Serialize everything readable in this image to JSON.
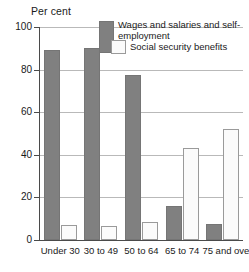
{
  "chart_data": {
    "type": "bar",
    "title": "",
    "ylabel": "Per cent",
    "xlabel": "",
    "ylim": [
      0,
      100
    ],
    "yticks": [
      0,
      20,
      40,
      60,
      80,
      100
    ],
    "grid": true,
    "legend_position": "inside-top-right",
    "categories": [
      "Under 30",
      "30 to 49",
      "50 to 64",
      "65 to 74",
      "75 and over"
    ],
    "series": [
      {
        "name": "Wages and salaries and self-employment",
        "color": "#808080",
        "values": [
          89,
          90,
          77.5,
          16,
          7.5
        ]
      },
      {
        "name": "Social security benefits",
        "color": "#fbfbfb",
        "values": [
          7,
          6.5,
          8.5,
          43,
          52
        ]
      }
    ]
  },
  "axis": {
    "y_title": "Per cent",
    "tick_labels": [
      "100",
      "80",
      "60",
      "40",
      "20",
      "0"
    ]
  },
  "legend": {
    "entry_1": "Wages and salaries and self-employment",
    "entry_2": "Social security benefits"
  },
  "categories": [
    "Under 30",
    "30 to 49",
    "50 to 64",
    "65 to 74",
    "75 and over"
  ]
}
